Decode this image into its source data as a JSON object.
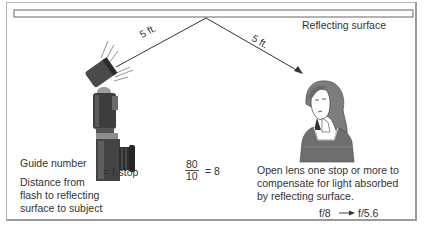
{
  "diagram": {
    "surface_label": "Reflecting surface",
    "distance_1": "5 ft.",
    "distance_2": "5 ft.",
    "formula": {
      "numerator_label": "Guide number",
      "denominator_label_lines": [
        "Distance from",
        "flash to reflecting",
        "surface to subject"
      ],
      "equals_label": "= f-stop",
      "example_numerator": "80",
      "example_denominator": "10",
      "example_result": "= 8"
    },
    "note_lines": [
      "Open lens one stop or more to",
      "compensate for light absorbed",
      "by reflecting surface."
    ],
    "stop_change": {
      "from": "f/8",
      "to": "f/5.6"
    },
    "illustrations": [
      "flash-camera",
      "woman-subject"
    ],
    "colors": {
      "line": "#333333",
      "text": "#333333",
      "border": "#9a9a9a"
    }
  }
}
